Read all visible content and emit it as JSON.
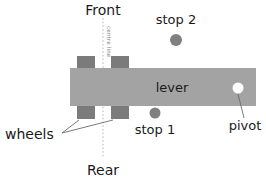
{
  "diagram": {
    "title_top": "Front",
    "title_bottom": "Rear",
    "centre_line_label": "centre line",
    "lever_label": "lever",
    "pivot_label": "pivot",
    "wheels_label": "wheels",
    "stop1_label": "stop 1",
    "stop2_label": "stop 2",
    "colors": {
      "background": "#ffffff",
      "lever_fill": "#a3a3a3",
      "wheel_fill": "#7b7b7b",
      "stop_fill": "#808080",
      "pivot_fill": "#ffffff",
      "text": "#1a1a1a",
      "centre_line": "#b4b4b4",
      "leader_line": "#6b6b6b"
    },
    "geometry": {
      "lever": {
        "x": 70,
        "y": 68,
        "width": 186,
        "height": 38
      },
      "centre_line_x": 103,
      "pivot": {
        "cx": 238,
        "cy": 88,
        "r": 5.5
      },
      "stop1": {
        "cx": 155,
        "cy": 113,
        "r": 5.5
      },
      "stop2": {
        "cx": 176,
        "cy": 40,
        "r": 6
      },
      "wheels": [
        {
          "x": 77,
          "y": 56,
          "width": 18,
          "height": 13
        },
        {
          "x": 111,
          "y": 56,
          "width": 18,
          "height": 13
        },
        {
          "x": 77,
          "y": 105,
          "width": 18,
          "height": 14
        },
        {
          "x": 111,
          "y": 105,
          "width": 18,
          "height": 14
        }
      ]
    }
  }
}
